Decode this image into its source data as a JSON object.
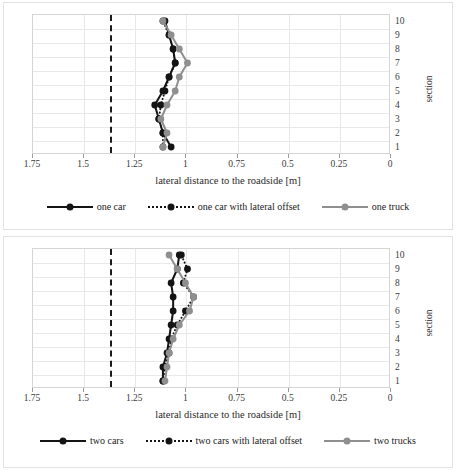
{
  "figure": {
    "panels": [
      {
        "id": "one-vehicle",
        "axis_title_x": "lateral distance to the roadside [m]",
        "axis_title_y": "section",
        "xticks": [
          "1.75",
          "1.5",
          "1.25",
          "1",
          "0.75",
          "0.5",
          "0.25",
          "0"
        ],
        "yticks": [
          "10",
          "9",
          "8",
          "7",
          "6",
          "5",
          "4",
          "3",
          "2",
          "1"
        ],
        "legend": [
          {
            "label": "one car",
            "style": "solid",
            "color": "#141414"
          },
          {
            "label": "one car with lateral offset",
            "style": "dotted",
            "color": "#141414"
          },
          {
            "label": "one truck",
            "style": "solid",
            "color": "#8f8f8f"
          }
        ]
      },
      {
        "id": "two-vehicles",
        "axis_title_x": "lateral distance to the roadside [m]",
        "axis_title_y": "section",
        "xticks": [
          "1.75",
          "1.5",
          "1.25",
          "1",
          "0.75",
          "0.5",
          "0.25",
          "0"
        ],
        "yticks": [
          "10",
          "9",
          "8",
          "7",
          "6",
          "5",
          "4",
          "3",
          "2",
          "1"
        ],
        "legend": [
          {
            "label": "two cars",
            "style": "solid",
            "color": "#141414"
          },
          {
            "label": "two cars with lateral offset",
            "style": "dotted",
            "color": "#141414"
          },
          {
            "label": "two trucks",
            "style": "solid",
            "color": "#8f8f8f"
          }
        ]
      }
    ]
  },
  "chart_data": [
    {
      "type": "line",
      "title": "",
      "xlabel": "lateral distance to the roadside [m]",
      "ylabel": "section",
      "xlim": [
        1.75,
        0
      ],
      "ylim": [
        1,
        10
      ],
      "x_axis_reversed": true,
      "grid": true,
      "legend_position": "bottom",
      "categories": [
        1,
        2,
        3,
        4,
        5,
        6,
        7,
        8,
        9,
        10
      ],
      "reference_line": {
        "value": 1.375,
        "style": "dashed",
        "color": "#1b1b1b"
      },
      "series": [
        {
          "name": "one car",
          "style": "solid",
          "color": "#141414",
          "values": [
            1.07,
            1.11,
            1.13,
            1.15,
            1.11,
            1.08,
            1.05,
            1.06,
            1.08,
            1.1
          ]
        },
        {
          "name": "one car with lateral offset",
          "style": "dotted",
          "color": "#141414",
          "values": [
            1.11,
            1.11,
            1.13,
            1.12,
            1.1,
            1.08,
            1.05,
            1.06,
            1.08,
            1.11
          ]
        },
        {
          "name": "one truck",
          "style": "solid",
          "color": "#8f8f8f",
          "values": [
            1.11,
            1.09,
            1.12,
            1.09,
            1.05,
            1.03,
            0.99,
            1.03,
            1.07,
            1.11
          ]
        }
      ]
    },
    {
      "type": "line",
      "title": "",
      "xlabel": "lateral distance to the roadside [m]",
      "ylabel": "section",
      "xlim": [
        1.75,
        0
      ],
      "ylim": [
        1,
        10
      ],
      "x_axis_reversed": true,
      "grid": true,
      "legend_position": "bottom",
      "categories": [
        1,
        2,
        3,
        4,
        5,
        6,
        7,
        8,
        9,
        10
      ],
      "reference_line": {
        "value": 1.375,
        "style": "dashed",
        "color": "#1b1b1b"
      },
      "series": [
        {
          "name": "two cars",
          "style": "solid",
          "color": "#141414",
          "values": [
            1.11,
            1.11,
            1.09,
            1.08,
            1.07,
            1.06,
            1.06,
            1.07,
            1.04,
            1.03
          ]
        },
        {
          "name": "two cars with lateral offset",
          "style": "dotted",
          "color": "#141414",
          "values": [
            1.11,
            1.1,
            1.08,
            1.07,
            1.04,
            1.0,
            0.96,
            1.01,
            0.99,
            1.02
          ]
        },
        {
          "name": "two trucks",
          "style": "solid",
          "color": "#8f8f8f",
          "values": [
            1.1,
            1.09,
            1.08,
            1.06,
            1.03,
            0.98,
            0.96,
            1.0,
            1.04,
            1.08
          ]
        }
      ]
    }
  ]
}
